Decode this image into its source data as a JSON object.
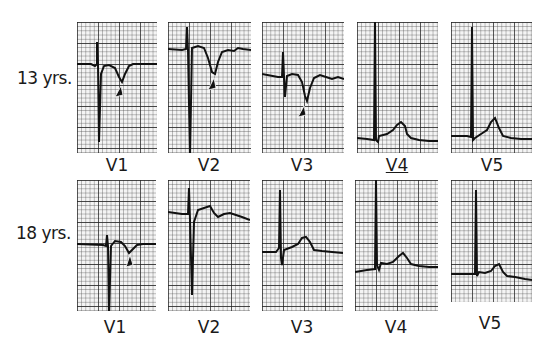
{
  "figure": {
    "rows": [
      {
        "label": "13 yrs.",
        "panels": [
          {
            "lead": "V1",
            "annotation": "arrowhead marking inverted T wave"
          },
          {
            "lead": "V2",
            "annotation": "arrowhead marking inverted T wave"
          },
          {
            "lead": "V3",
            "annotation": "arrowhead marking inverted T wave"
          },
          {
            "lead": "V4",
            "annotation": ""
          },
          {
            "lead": "V5",
            "annotation": ""
          }
        ]
      },
      {
        "label": "18 yrs.",
        "panels": [
          {
            "lead": "V1",
            "annotation": "arrowhead marking shallow inverted T wave"
          },
          {
            "lead": "V2",
            "annotation": ""
          },
          {
            "lead": "V3",
            "annotation": ""
          },
          {
            "lead": "V4",
            "annotation": ""
          },
          {
            "lead": "V5",
            "annotation": ""
          }
        ]
      }
    ],
    "colors": {
      "grid": "#3a3a3a",
      "paper": "#f2f2f2",
      "trace": "#111111",
      "arrow": "#111111"
    }
  }
}
